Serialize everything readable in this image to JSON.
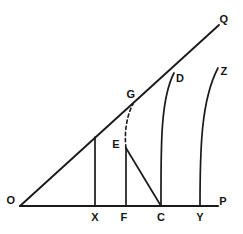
{
  "figure": {
    "background_color": "#ffffff",
    "stroke_color": "#1a1a1a",
    "width": 243,
    "height": 234
  },
  "labels": {
    "O": "O",
    "P": "P",
    "Q": "Q",
    "X": "X",
    "F": "F",
    "C": "C",
    "Y": "Y",
    "E": "E",
    "G": "G",
    "D": "D",
    "Z": "Z"
  },
  "points": {
    "O": {
      "x": 20,
      "y": 206,
      "label_x": 11,
      "label_y": 200
    },
    "P": {
      "x": 218,
      "y": 206,
      "label_x": 223,
      "label_y": 201
    },
    "Q": {
      "x": 219,
      "y": 25,
      "label_x": 224,
      "label_y": 19
    },
    "X": {
      "x": 95,
      "y": 206,
      "label_x": 95,
      "label_y": 217
    },
    "F": {
      "x": 126,
      "y": 206,
      "label_x": 124,
      "label_y": 217
    },
    "C": {
      "x": 161,
      "y": 206,
      "label_x": 161,
      "label_y": 217
    },
    "Y": {
      "x": 200,
      "y": 206,
      "label_x": 200,
      "label_y": 217
    },
    "E": {
      "x": 126,
      "y": 148,
      "label_x": 116,
      "label_y": 144
    },
    "G": {
      "x": 133,
      "y": 104,
      "label_x": 131,
      "label_y": 94
    },
    "D": {
      "x": 174,
      "y": 73,
      "label_x": 180,
      "label_y": 78
    },
    "Z": {
      "x": 218,
      "y": 68,
      "label_x": 224,
      "label_y": 71
    }
  },
  "segments": {
    "baseline_OP": "M 20 206 L 218 206",
    "ray_OQ": "M 20 206 L 219 25",
    "drop_X": "M 95 137 L 95 206",
    "drop_EF": "M 126 148 L 126 206",
    "diagonal_EC": "M 126 148 L 161 206"
  },
  "curves": {
    "dashed_EG": "M 126 148 C 124 132 127 115 133 104",
    "curve_CD": "M 161 206 C 161 150 160 100 174 73",
    "curve_YZ": "M 200 206 C 200 150 201 100 218 68"
  }
}
